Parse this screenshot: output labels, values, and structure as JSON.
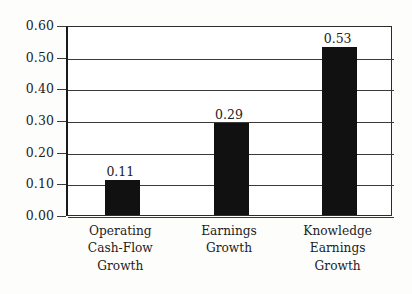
{
  "chart_data": {
    "type": "bar",
    "title": "",
    "subtitle": "",
    "xlabel": "",
    "ylabel": "",
    "categories": [
      "Operating Cash-Flow Growth",
      "Earnings Growth",
      "Knowledge Earnings Growth"
    ],
    "category_lines": [
      [
        "Operating",
        "Cash-Flow",
        "Growth"
      ],
      [
        "Earnings",
        "Growth"
      ],
      [
        "Knowledge",
        "Earnings",
        "Growth"
      ]
    ],
    "values": [
      0.11,
      0.29,
      0.53
    ],
    "value_labels": [
      "0.11",
      "0.29",
      "0.53"
    ],
    "ylim": [
      0.0,
      0.6
    ],
    "ytick_values": [
      0.6,
      0.5,
      0.4,
      0.3,
      0.2,
      0.1,
      0.0
    ],
    "ytick_labels": [
      "0.60",
      "0.50",
      "0.40",
      "0.30",
      "0.20",
      "0.10",
      "0.00"
    ],
    "grid": true,
    "grid_axis": "y",
    "legend": false,
    "legend_position": "none",
    "bar_color": "#111111",
    "axis_color": "#1a1a1a",
    "grid_color": "#3a3a3a",
    "background_color": "#fdfdfc",
    "plot_background_color": "#ffffff",
    "text_color": "#1d1d1d"
  }
}
